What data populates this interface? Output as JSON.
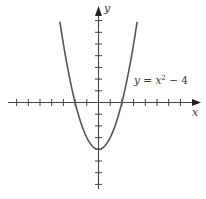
{
  "chart_data": {
    "type": "line",
    "title": "",
    "function": "y = x^2 - 4",
    "annotation": {
      "text_prefix": "y = x",
      "exponent": "2",
      "text_suffix": " − 4"
    },
    "xlabel": "x",
    "ylabel": "y",
    "xlim": [
      -7.5,
      8.6
    ],
    "ylim": [
      -7.5,
      8.6
    ],
    "x_ticks": [
      -7,
      -6,
      -5,
      -4,
      -3,
      -2,
      -1,
      1,
      2,
      3,
      4,
      5,
      6,
      7
    ],
    "y_ticks": [
      -7,
      -6,
      -5,
      -4,
      -3,
      -2,
      -1,
      1,
      2,
      3,
      4,
      5,
      6,
      7
    ],
    "tick_labels_shown": false,
    "grid": false,
    "series": [
      {
        "name": "y = x^2 - 4",
        "x": [
          -3.3,
          -3,
          -2.5,
          -2,
          -1.5,
          -1,
          -0.5,
          0,
          0.5,
          1,
          1.5,
          2,
          2.5,
          3,
          3.3
        ],
        "y": [
          6.89,
          5,
          2.25,
          0,
          -1.75,
          -3,
          -3.75,
          -4,
          -3.75,
          -3,
          -1.75,
          0,
          2.25,
          5,
          6.89
        ]
      }
    ],
    "key_points": {
      "vertex": [
        0,
        -4
      ],
      "x_intercepts": [
        -2,
        2
      ]
    },
    "colors": {
      "curve": "#555555",
      "axes": "#444444"
    }
  }
}
